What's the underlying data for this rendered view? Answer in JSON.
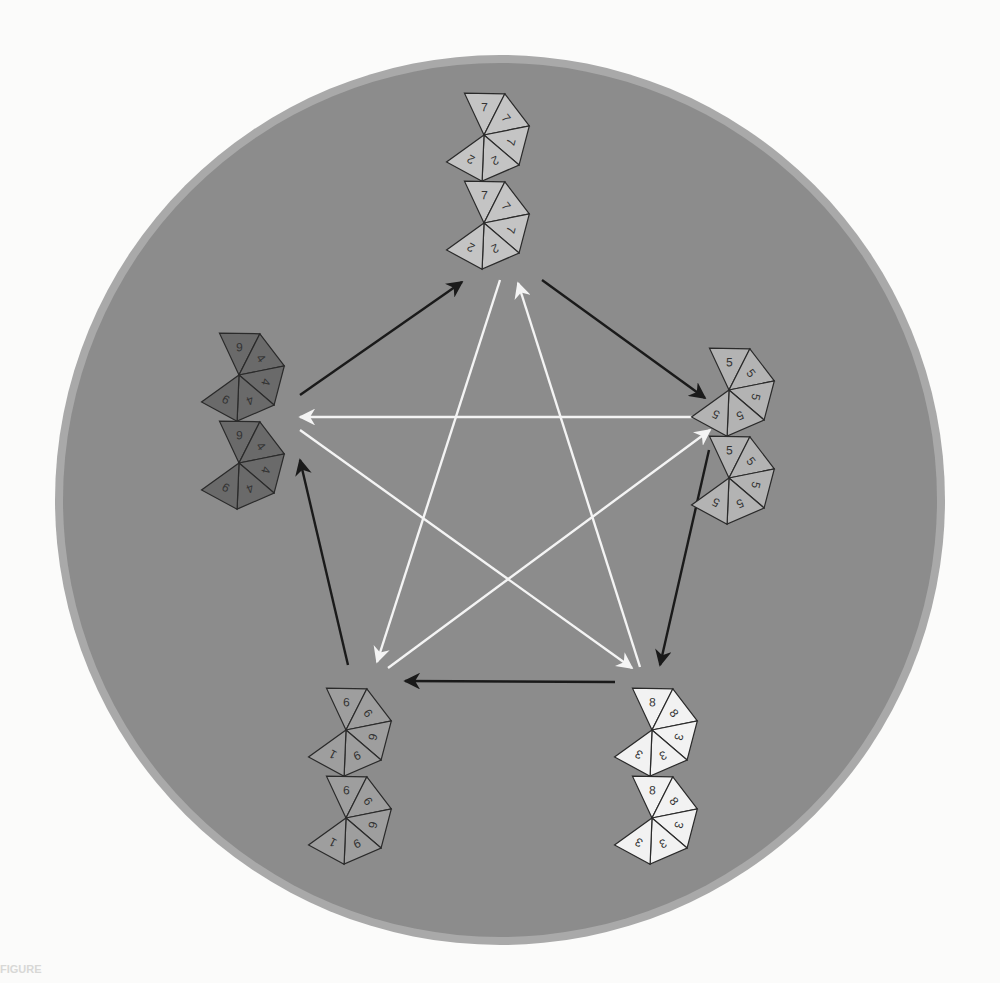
{
  "page": {
    "background_text_title": "r Cycles of Lenders",
    "caption_label": "FIGURE"
  },
  "diagram": {
    "type": "non-transitive-dice-cycle",
    "disk": {
      "cx": 500,
      "cy": 500,
      "r": 445,
      "fill": "#8c8c8c",
      "rim": "#a9a9a9"
    },
    "dice": [
      {
        "id": "top",
        "position": "top",
        "cx": 500,
        "cy": 175,
        "fill": "#c4c4c4",
        "faces": [
          "7",
          "7",
          "7",
          "2",
          "2",
          "7",
          "7",
          "7",
          "2",
          "2"
        ]
      },
      {
        "id": "right",
        "position": "right",
        "cx": 745,
        "cy": 430,
        "fill": "#b3b3b3",
        "faces": [
          "5",
          "5",
          "5",
          "5",
          "5",
          "5",
          "5",
          "5",
          "5",
          "5"
        ]
      },
      {
        "id": "bottom-right",
        "position": "bottom-right",
        "cx": 668,
        "cy": 770,
        "fill": "#f2f2f2",
        "faces": [
          "8",
          "8",
          "3",
          "3",
          "3",
          "8",
          "8",
          "3",
          "3",
          "3"
        ]
      },
      {
        "id": "bottom-left",
        "position": "bottom-left",
        "cx": 362,
        "cy": 770,
        "fill": "#9e9e9e",
        "faces": [
          "6",
          "6",
          "6",
          "9",
          "1",
          "6",
          "6",
          "6",
          "9",
          "1"
        ]
      },
      {
        "id": "left",
        "position": "left",
        "cx": 255,
        "cy": 415,
        "fill": "#6a6a6a",
        "faces": [
          "9",
          "4",
          "4",
          "4",
          "9",
          "9",
          "4",
          "4",
          "4",
          "9"
        ]
      }
    ],
    "arrows": [
      {
        "color": "black",
        "from": "left",
        "to": "top",
        "x1": 300,
        "y1": 395,
        "x2": 462,
        "y2": 282
      },
      {
        "color": "black",
        "from": "top",
        "to": "right",
        "x1": 542,
        "y1": 280,
        "x2": 705,
        "y2": 398
      },
      {
        "color": "black",
        "from": "right",
        "to": "bottom-right",
        "x1": 709,
        "y1": 450,
        "x2": 660,
        "y2": 665
      },
      {
        "color": "black",
        "from": "bottom-right",
        "to": "bottom-left",
        "x1": 615,
        "y1": 682,
        "x2": 405,
        "y2": 681
      },
      {
        "color": "black",
        "from": "bottom-left",
        "to": "left",
        "x1": 348,
        "y1": 665,
        "x2": 300,
        "y2": 460
      },
      {
        "color": "white",
        "from": "right",
        "to": "left",
        "x1": 710,
        "y1": 417,
        "x2": 300,
        "y2": 417
      },
      {
        "color": "white",
        "from": "top",
        "to": "bottom-left",
        "x1": 500,
        "y1": 280,
        "x2": 377,
        "y2": 662
      },
      {
        "color": "white",
        "from": "bottom-right",
        "to": "top",
        "x1": 640,
        "y1": 667,
        "x2": 518,
        "y2": 283
      },
      {
        "color": "white",
        "from": "left",
        "to": "bottom-right",
        "x1": 300,
        "y1": 430,
        "x2": 632,
        "y2": 668
      },
      {
        "color": "white",
        "from": "bottom-left",
        "to": "right",
        "x1": 388,
        "y1": 668,
        "x2": 710,
        "y2": 430
      }
    ]
  }
}
